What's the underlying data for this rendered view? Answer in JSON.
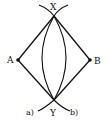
{
  "diagram": {
    "type": "geometric-construction",
    "colors": {
      "stroke": "#111111",
      "background": "#ffffff"
    },
    "points": [
      {
        "id": "X",
        "label": "X",
        "x": 54,
        "y": 16
      },
      {
        "id": "Y",
        "label": "Y",
        "x": 54,
        "y": 100
      },
      {
        "id": "A",
        "label": "A",
        "x": 18,
        "y": 60
      },
      {
        "id": "B",
        "label": "B",
        "x": 90,
        "y": 60
      }
    ],
    "segments": [
      "AX",
      "XB",
      "AY",
      "YB"
    ],
    "arcs": [
      {
        "id": "a",
        "label": "a)"
      },
      {
        "id": "b",
        "label": "b)"
      }
    ]
  }
}
